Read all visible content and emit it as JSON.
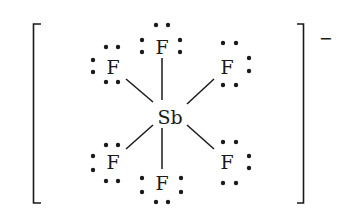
{
  "diagram": {
    "type": "lewis-structure",
    "molecule": "SbF6-",
    "central_atom": {
      "symbol": "Sb",
      "x": 170,
      "y": 117
    },
    "ligands": [
      {
        "id": "f-top",
        "symbol": "F",
        "x": 162,
        "y": 47,
        "lone_pairs": 3
      },
      {
        "id": "f-upper-left",
        "symbol": "F",
        "x": 113,
        "y": 67,
        "lone_pairs": 3
      },
      {
        "id": "f-upper-right",
        "symbol": "F",
        "x": 227,
        "y": 67,
        "lone_pairs": 3
      },
      {
        "id": "f-lower-left",
        "symbol": "F",
        "x": 113,
        "y": 162,
        "lone_pairs": 3
      },
      {
        "id": "f-lower-right",
        "symbol": "F",
        "x": 227,
        "y": 162,
        "lone_pairs": 3
      },
      {
        "id": "f-bottom",
        "symbol": "F",
        "x": 162,
        "y": 183,
        "lone_pairs": 3
      }
    ],
    "charge": "−",
    "colors": {
      "ink": "#1a1a1a",
      "background": "#ffffff"
    }
  }
}
